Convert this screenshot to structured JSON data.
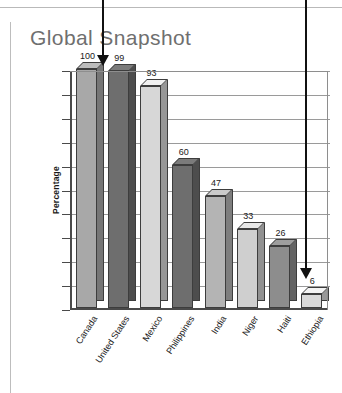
{
  "page": {
    "title": "Global Snapshot"
  },
  "annotations": [
    {
      "name": "arrow-to-canada-bar",
      "glyph": "down-arrow"
    },
    {
      "name": "arrow-to-ethiopia-bar",
      "glyph": "down-arrow"
    }
  ],
  "chart_data": {
    "type": "bar",
    "title": "Global Snapshot",
    "xlabel": "",
    "ylabel": "Percentage",
    "ylim": [
      0,
      100
    ],
    "yticks": [
      0,
      10,
      20,
      30,
      40,
      50,
      60,
      70,
      80,
      90,
      100
    ],
    "grid": true,
    "legend": null,
    "categories": [
      "Canada",
      "United States",
      "Mexico",
      "Philippines",
      "India",
      "Niger",
      "Haiti",
      "Ethiopia"
    ],
    "values": [
      100,
      99,
      93,
      60,
      47,
      33,
      26,
      6
    ],
    "bar_colors": [
      "#a8a8a8",
      "#6e6e6e",
      "#d7d7d7",
      "#6e6e6e",
      "#b4b4b4",
      "#cfcfcf",
      "#8d8d8d",
      "#d9d9d9"
    ]
  },
  "colors": {
    "axis": "#4a4a4a",
    "grid": "#9a9a9a",
    "title": "#6f6f6f",
    "annotation": "#111111",
    "text": "#1a1a1a"
  }
}
